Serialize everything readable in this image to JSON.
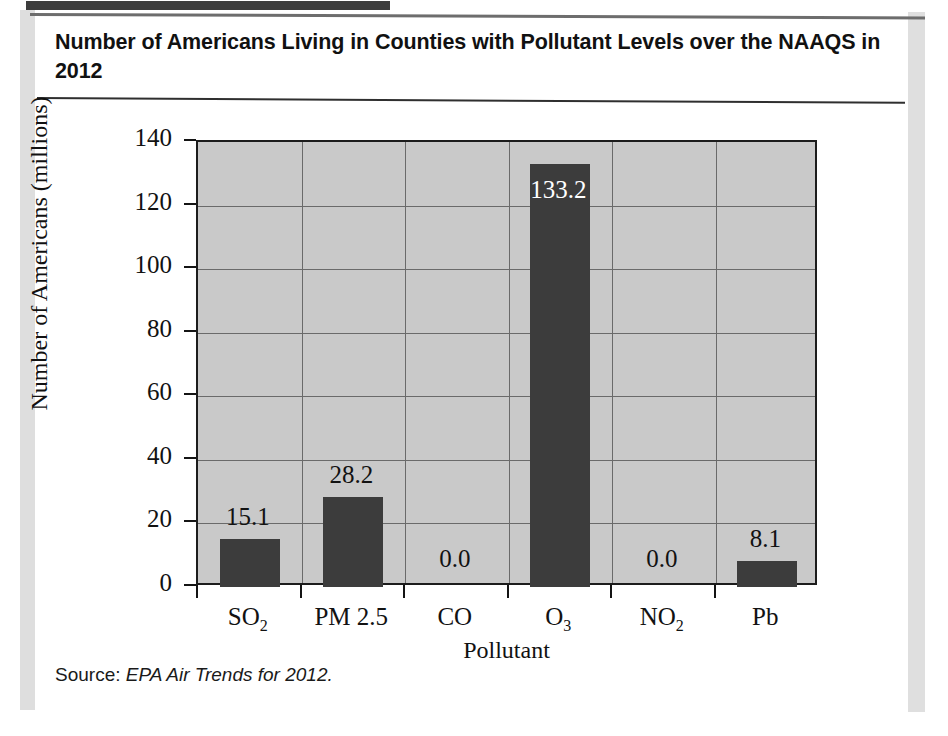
{
  "figure": {
    "title": "Number of Americans Living in Counties with Pollutant Levels over the NAAQS in 2012",
    "source_prefix": "Source:",
    "source_citation": "EPA Air Trends for 2012."
  },
  "colors": {
    "plot_background": "#c9c9c9",
    "bar_fill": "#3c3c3c",
    "axis": "#1c1c1c",
    "gridline": "#6a6a6a",
    "page_background": "#ffffff",
    "top_tab": "#3d3d3d"
  },
  "chart_data": {
    "type": "bar",
    "title": "Number of Americans Living in Counties with Pollutant Levels over the NAAQS in 2012",
    "xlabel": "Pollutant",
    "ylabel": "Number of Americans (millions)",
    "ylim": [
      0,
      140
    ],
    "ytick_interval": 20,
    "ytick_labels": [
      "0",
      "20",
      "40",
      "60",
      "80",
      "100",
      "120",
      "140"
    ],
    "ytick_values": [
      0,
      20,
      40,
      60,
      80,
      100,
      120,
      140
    ],
    "grid": "both",
    "legend": "none",
    "categories": [
      "SO2",
      "PM 2.5",
      "CO",
      "O3",
      "NO2",
      "Pb"
    ],
    "category_labels_html": [
      "SO<sub>2</sub>",
      "PM 2.5",
      "CO",
      "O<sub>3</sub>",
      "NO<sub>2</sub>",
      "Pb"
    ],
    "values": [
      15.1,
      28.2,
      0.0,
      133.2,
      0.0,
      8.1
    ],
    "data_labels": [
      "15.1",
      "28.2",
      "0.0",
      "133.2",
      "0.0",
      "8.1"
    ],
    "data_label_placement": [
      "above",
      "above",
      "baseline",
      "inside-top",
      "baseline",
      "above"
    ],
    "units": "millions of people"
  }
}
